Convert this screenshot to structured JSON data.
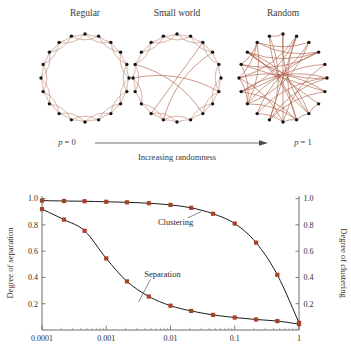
{
  "figure": {
    "panels": [
      {
        "id": "regular",
        "title": "Regular",
        "p_label_plain": "p = 0"
      },
      {
        "id": "small-world",
        "title": "Small world"
      },
      {
        "id": "random",
        "title": "Random",
        "p_label_plain": "p = 1"
      }
    ],
    "p_left_var": "p",
    "p_left_eq": " = 0",
    "p_right_var": "p",
    "p_right_eq": " = 1",
    "arrow_caption": "Increasing randomness",
    "network_nodes": 20,
    "edge_color": "#b5785f",
    "node_color": "#141414"
  },
  "chart_data": {
    "type": "line",
    "title": "",
    "xlabel": "",
    "ylabel": "Degree of separation",
    "y2label": "Degree of clustering",
    "xscale": "log",
    "xlim": [
      0.0001,
      1
    ],
    "ylim": [
      0,
      1.02
    ],
    "y2lim": [
      0,
      1.02
    ],
    "grid": false,
    "legend": "inline-annotations",
    "xticks": [
      0.0001,
      0.001,
      0.01,
      0.1,
      1
    ],
    "xticklabels": [
      "0.0001",
      "0.001",
      "0.01",
      "0.1",
      "1"
    ],
    "yticks": [
      0.2,
      0.4,
      0.6,
      0.8,
      1.0
    ],
    "yticklabels": [
      "0.2",
      "0.4",
      "0.6",
      "0.8",
      "1.0"
    ],
    "y2ticks": [
      0.2,
      0.4,
      0.6,
      0.8,
      1.0
    ],
    "y2ticklabels": [
      "0.2",
      "0.4",
      "0.6",
      "0.8",
      "1.0"
    ],
    "marker_color": "#a8412a",
    "line_color": "#1c1c1c",
    "annotations": [
      {
        "text": "Clustering",
        "x": 0.012,
        "y": 0.8
      },
      {
        "text": "Separation",
        "x": 0.0075,
        "y": 0.4
      }
    ],
    "series": [
      {
        "name": "Clustering",
        "x": [
          0.0001,
          0.00022,
          0.00046,
          0.001,
          0.0021,
          0.0046,
          0.01,
          0.021,
          0.046,
          0.1,
          0.215,
          0.46,
          1.0
        ],
        "values": [
          0.985,
          0.982,
          0.98,
          0.976,
          0.972,
          0.965,
          0.952,
          0.93,
          0.885,
          0.81,
          0.665,
          0.42,
          0.055
        ]
      },
      {
        "name": "Separation",
        "x": [
          0.0001,
          0.00022,
          0.00046,
          0.001,
          0.0021,
          0.0046,
          0.01,
          0.021,
          0.046,
          0.1,
          0.215,
          0.46,
          1.0
        ],
        "values": [
          0.92,
          0.84,
          0.755,
          0.545,
          0.37,
          0.255,
          0.185,
          0.145,
          0.115,
          0.095,
          0.08,
          0.068,
          0.045
        ]
      }
    ]
  }
}
